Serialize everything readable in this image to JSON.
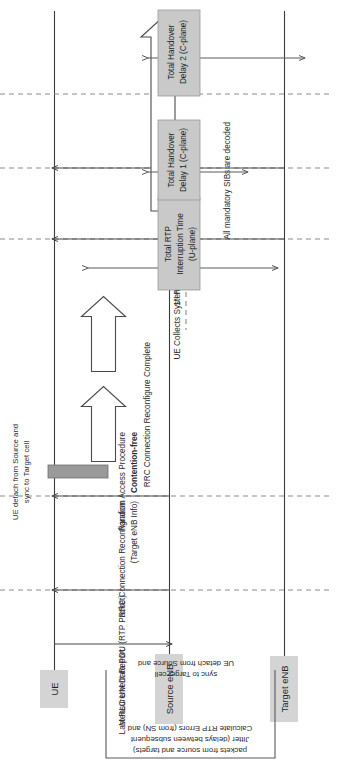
{
  "diagram": {
    "orientation": "rotated-90-ccw",
    "colors": {
      "lifeline": "#3b3b3b",
      "dashed_marker": "#8a8a8a",
      "label_box_fill": "#d4d4d4",
      "band_box_fill": "#c9c9c9",
      "detach_block_fill": "#9a9a9a",
      "text": "#2b2b2b",
      "background": "#ffffff"
    }
  },
  "lifelines": [
    {
      "id": "ue",
      "label": "UE"
    },
    {
      "id": "source",
      "label": "Source eNB"
    },
    {
      "id": "target",
      "label": "Target eNB"
    }
  ],
  "messages": [
    {
      "id": "m1",
      "label": "Measurement Report",
      "from": "ue",
      "to": "source",
      "style": "thin-arrow"
    },
    {
      "id": "m2",
      "label": "Last RLC UM Data PDU (RTP Packet)",
      "from": "source",
      "to": "ue",
      "style": "thin-arrow"
    },
    {
      "id": "m3",
      "label_line1": "RRC Connection Reconfigration",
      "label_line2": "(Target eNB Info)",
      "label": "RRC Connection Reconfigration (Target eNB Info)",
      "from": "source",
      "to": "ue",
      "style": "thin-arrow"
    },
    {
      "id": "m4",
      "label_line1": "Random Access Procedure",
      "label_line2": "Contention-free",
      "label_line2_bold": true,
      "label": "Random Access Procedure Contention-free",
      "from": "ue",
      "to": "target",
      "style": "block-arrow"
    },
    {
      "id": "m5",
      "label": "RRC Connection Reconfigure Complete",
      "from": "ue",
      "to": "target",
      "style": "block-arrow"
    },
    {
      "id": "m6",
      "label": "UE Collects System Information",
      "from": "target",
      "to": "ue",
      "style": "thin-arrow"
    },
    {
      "id": "m7",
      "label_prefix": "1",
      "label_sup": "st",
      "label_rest": " RLC UM Data PDU (RTP Packet)",
      "label": "1st RLC UM Data PDU (RTP Packet)",
      "from": "target",
      "to": "ue",
      "style": "thin-arrow"
    },
    {
      "id": "m8",
      "label": "All mandatory SIBs are decoded",
      "from": "ue",
      "to": "target",
      "style": "block-arrow"
    }
  ],
  "activation_blocks": [
    {
      "id": "detach",
      "on": "ue",
      "label": ""
    }
  ],
  "notes": [
    {
      "id": "note-detach",
      "lines": [
        "UE detach from Source and",
        "sync to Target cell"
      ],
      "text": "UE detach from Source and sync to Target cell"
    },
    {
      "id": "note-rtp",
      "lines": [
        "Calculate RTP Errors (from SN) and",
        "Jitter (delays between subsequent",
        "packets from source and targets)"
      ],
      "text": "Calculate RTP Errors (from SN) and Jitter (delays between subsequent packets from source and targets)"
    }
  ],
  "measurement_bands": [
    {
      "id": "band-rtp",
      "lines": [
        "Total RTP",
        "Interruption Time",
        "(U-plane)"
      ],
      "label": "Total RTP Interruption Time (U-plane)",
      "arrow": "double"
    },
    {
      "id": "band-ho1",
      "lines": [
        "Total Handover",
        "Delay 1 (C-plane)"
      ],
      "label": "Total Handover Delay 1 (C-plane)",
      "arrow": "double"
    },
    {
      "id": "band-ho2",
      "lines": [
        "Total Handover",
        "Delay 2 (C-plane)"
      ],
      "label": "Total Handover Delay 2 (C-plane)",
      "arrow": "double"
    }
  ]
}
